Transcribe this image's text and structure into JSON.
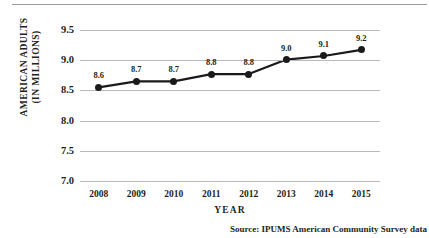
{
  "figure": {
    "top_rule": "horizontal-rule",
    "source_note": "Source:  IPUMS American Community Survey data"
  },
  "chart_data": {
    "type": "line",
    "title": "",
    "subtitle": "",
    "xlabel": "YEAR",
    "ylabel": "AMERICAN ADULTS (IN MILLIONS)",
    "ylabel_lines": [
      "AMERICAN ADULTS",
      "(IN MILLIONS)"
    ],
    "categories": [
      "2008",
      "2009",
      "2010",
      "2011",
      "2012",
      "2013",
      "2014",
      "2015"
    ],
    "values": [
      8.55,
      8.65,
      8.65,
      8.77,
      8.77,
      9.01,
      9.07,
      9.17
    ],
    "point_labels": [
      "8.6",
      "8.7",
      "8.7",
      "8.8",
      "8.8",
      "9.0",
      "9.1",
      "9.2"
    ],
    "ylim": [
      7.0,
      9.5
    ],
    "yticks": [
      "9.5",
      "9.0",
      "8.5",
      "8.0",
      "7.5",
      "7.0"
    ],
    "ytick_values": [
      9.5,
      9.0,
      8.5,
      8.0,
      7.5,
      7.0
    ],
    "grid": true,
    "grid_axis": "y",
    "legend": false,
    "legend_position": "none",
    "line_color": "#1a1a1a",
    "marker_color": "#1a1a1a",
    "grid_color": "#b9b9b9",
    "background_color": "#ffffff"
  }
}
